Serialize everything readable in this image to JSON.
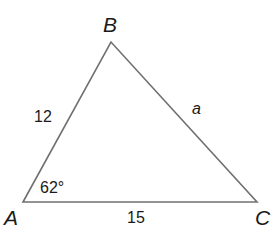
{
  "diagram": {
    "type": "triangle",
    "vertices": [
      {
        "name": "A",
        "label": "A"
      },
      {
        "name": "B",
        "label": "B"
      },
      {
        "name": "C",
        "label": "C"
      }
    ],
    "sides": [
      {
        "between": "AB",
        "label": "12"
      },
      {
        "between": "BC",
        "label": "a"
      },
      {
        "between": "AC",
        "label": "15"
      }
    ],
    "angles": [
      {
        "at": "A",
        "label": "62°"
      }
    ],
    "colors": {
      "stroke": "#707070",
      "text": "#1a1a1a",
      "background": "#ffffff"
    }
  }
}
